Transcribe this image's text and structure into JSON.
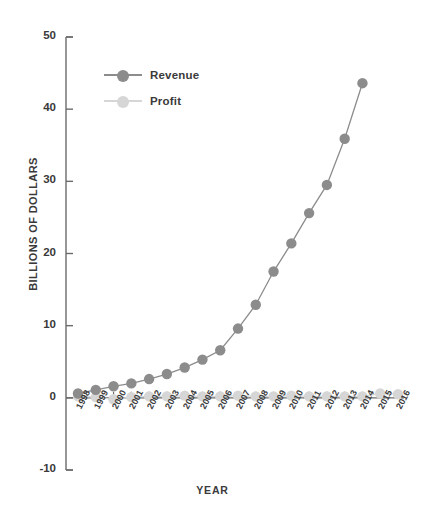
{
  "chart_data": {
    "type": "line",
    "title": "",
    "xlabel": "YEAR",
    "ylabel": "BILLIONS OF DOLLARS",
    "xlim": [
      1997.5,
      2016.5
    ],
    "ylim": [
      -10,
      50
    ],
    "yticks": [
      50,
      40,
      30,
      20,
      10,
      0,
      -10
    ],
    "grid": false,
    "legend_position": "upper-left-inside",
    "categories": [
      1998,
      1999,
      2000,
      2001,
      2002,
      2003,
      2004,
      2005,
      2006,
      2007,
      2008,
      2009,
      2010,
      2011,
      2012,
      2013,
      2014,
      2015,
      2016
    ],
    "tick_labels": [
      "1998",
      "1999",
      "2000",
      "2001",
      "2002",
      "2003",
      "2004",
      "2005",
      "2006",
      "2007",
      "2008",
      "2009",
      "2010",
      "2011",
      "2012",
      "2013",
      "2014",
      "2015",
      "2016"
    ],
    "series": [
      {
        "name": "Revenue",
        "color": "#8c8c8c",
        "values": [
          0.6,
          1.6,
          2.8,
          3.1,
          3.9,
          5.3,
          6.9,
          8.5,
          10.7,
          14.8,
          19.2,
          24.5,
          34.2,
          48.1,
          61.1,
          74.5,
          89.0,
          107.0,
          null
        ]
      },
      {
        "name": "Profit",
        "color": "#d6d6d6",
        "values": [
          -0.1,
          -0.7,
          -1.4,
          -0.6,
          -0.1,
          0.04,
          0.6,
          0.4,
          0.2,
          0.5,
          0.6,
          0.9,
          1.2,
          0.6,
          -0.04,
          0.3,
          0.2,
          -0.2,
          0.6
        ]
      }
    ],
    "revenue_plotted": [
      0.6,
      1.1,
      1.6,
      2.0,
      2.6,
      3.3,
      4.2,
      5.3,
      6.6,
      9.6,
      12.9,
      17.5,
      21.4,
      25.6,
      29.5,
      35.9,
      43.6
    ],
    "revenue_plotted_years": [
      1998,
      1999,
      2000,
      2001,
      2002,
      2003,
      2004,
      2005,
      2006,
      2007,
      2008,
      2009,
      2010,
      2011,
      2012,
      2013,
      2014,
      2015
    ],
    "profit_plotted": [
      0.2,
      0.1,
      -0.2,
      0.1,
      0.2,
      0.2,
      0.3,
      0.2,
      0.2,
      0.3,
      0.2,
      0.2,
      0.3,
      0.2,
      0.2,
      0.2,
      0.2,
      0.6,
      0.5
    ]
  },
  "legend": {
    "items": [
      {
        "label": "Revenue",
        "color": "#8c8c8c"
      },
      {
        "label": "Profit",
        "color": "#d6d6d6"
      }
    ]
  },
  "axes": {
    "y_title": "BILLIONS OF DOLLARS",
    "x_title": "YEAR",
    "y_tick_labels": [
      "50",
      "40",
      "30",
      "20",
      "10",
      "0",
      "-10"
    ],
    "x_tick_labels": [
      "1998",
      "1999",
      "2000",
      "2001",
      "2002",
      "2003",
      "2004",
      "2005",
      "2006",
      "2007",
      "2008",
      "2009",
      "2010",
      "2011",
      "2012",
      "2013",
      "2014",
      "2015",
      "2016"
    ]
  },
  "colors": {
    "revenue": "#8c8c8c",
    "profit": "#d6d6d6",
    "axis": "#6b6b6b",
    "text": "#3a3a3a",
    "background": "#ffffff"
  }
}
